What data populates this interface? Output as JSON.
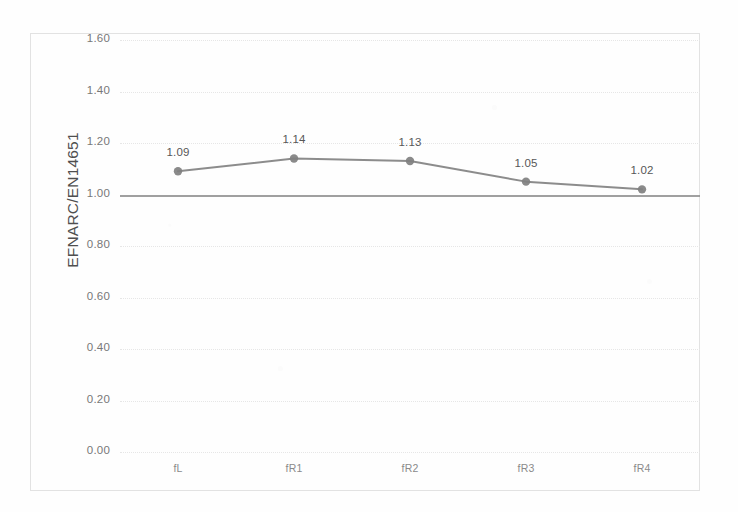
{
  "chart_data": {
    "type": "line",
    "title": "",
    "xlabel": "",
    "ylabel": "EFNARC/EN14651",
    "categories": [
      "fL",
      "fR1",
      "fR2",
      "fR3",
      "fR4"
    ],
    "values": [
      1.09,
      1.14,
      1.13,
      1.05,
      1.02
    ],
    "point_labels": [
      "1.09",
      "1.14",
      "1.13",
      "1.05",
      "1.02"
    ],
    "series": [
      {
        "name": "EFNARC/EN14651",
        "values": [
          1.09,
          1.14,
          1.13,
          1.05,
          1.02
        ],
        "color": "#808080",
        "marker": "circle"
      }
    ],
    "reference_line": {
      "value": 1.0,
      "label": "1.00",
      "color": "#8f8f8f"
    },
    "ylim": [
      0.0,
      1.6
    ],
    "ytick_step": 0.2,
    "ytick_labels": [
      "0.00",
      "0.20",
      "0.40",
      "0.60",
      "0.80",
      "1.00",
      "1.20",
      "1.40",
      "1.60"
    ],
    "ytick_values": [
      0.0,
      0.2,
      0.4,
      0.6,
      0.8,
      1.0,
      1.2,
      1.4,
      1.6
    ],
    "grid": true,
    "grid_style": "dotted",
    "legend": false,
    "legend_position": "none",
    "plot_background": "#ffffff",
    "frame_border_color": "#e2e2e2",
    "data_label_color": "#575757",
    "tick_label_color": "#787878"
  }
}
